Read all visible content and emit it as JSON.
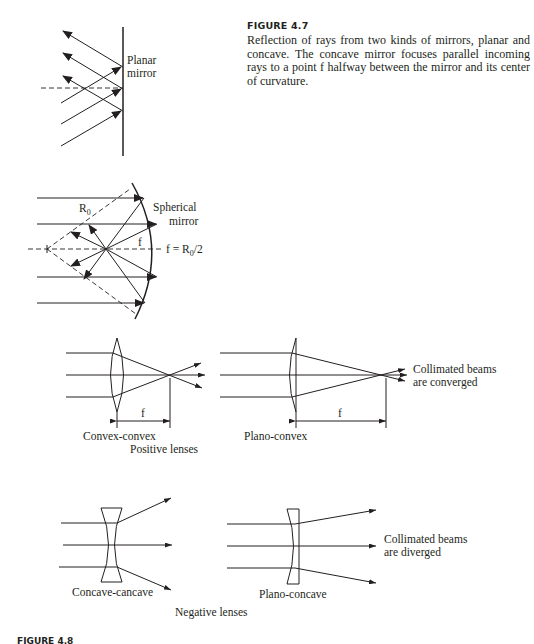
{
  "figure_4_7": {
    "title": "FIGURE 4.7",
    "caption": "Reflection of rays from two kinds of mirrors, planar and concave. The concave mirror focuses parallel incoming rays to a point f halfway between the mirror and its center of curvature.",
    "planar_mirror": {
      "label_line1": "Planar",
      "label_line2": "mirror"
    },
    "spherical_mirror": {
      "label_line1": "Spherical",
      "label_line2": "mirror",
      "radius_label": "R",
      "radius_sub": "0",
      "focal_label": "f",
      "relation_prefix": "f = R",
      "relation_sub": "0",
      "relation_suffix": "/2"
    }
  },
  "lenses": {
    "positive": {
      "group_label": "Positive lenses",
      "convex_convex": {
        "label": "Convex-convex",
        "focal_label": "f"
      },
      "plano_convex": {
        "label": "Plano-convex",
        "focal_label": "f"
      },
      "note_line1": "Collimated beams",
      "note_line2": "are converged"
    },
    "negative": {
      "group_label": "Negative lenses",
      "concave_concave": {
        "label": "Concave-cancave"
      },
      "plano_concave": {
        "label": "Plano-concave"
      },
      "note_line1": "Collimated beams",
      "note_line2": "are diverged"
    }
  },
  "figure_4_8": {
    "title": "FIGURE 4.8"
  },
  "colors": {
    "ink": "#231f20",
    "background": "#ffffff"
  }
}
